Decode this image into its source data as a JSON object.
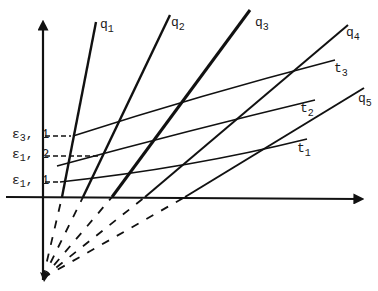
{
  "diagram": {
    "stroke_color": "#111111",
    "background": "#ffffff",
    "q_lines": [
      {
        "label": "q",
        "sub": "1"
      },
      {
        "label": "q",
        "sub": "2"
      },
      {
        "label": "q",
        "sub": "3"
      },
      {
        "label": "q",
        "sub": "4"
      },
      {
        "label": "q",
        "sub": "5"
      }
    ],
    "t_curves": [
      {
        "label": "t",
        "sub": "1"
      },
      {
        "label": "t",
        "sub": "2"
      },
      {
        "label": "t",
        "sub": "3"
      }
    ],
    "epsilon_labels": [
      {
        "label": "ε",
        "sub": "3",
        "suffix": ", 1"
      },
      {
        "label": "ε",
        "sub": "1",
        "suffix": ", 2"
      },
      {
        "label": "ε",
        "sub": "1",
        "suffix": ", 1"
      }
    ]
  }
}
